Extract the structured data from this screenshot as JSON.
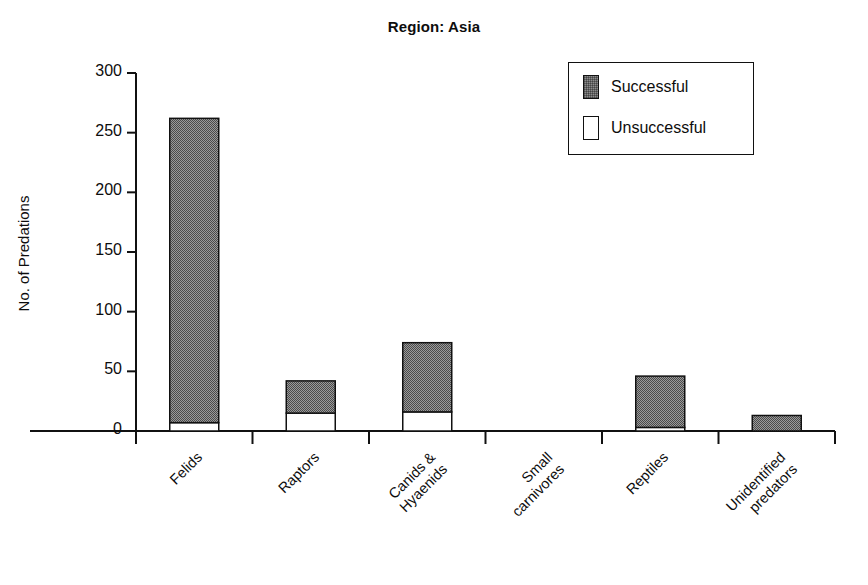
{
  "chart_data": {
    "type": "bar",
    "subtype": "stacked",
    "title": "Region: Asia",
    "xlabel": "",
    "ylabel": "No. of Predations",
    "categories": [
      "Felids",
      "Raptors",
      "Canids &\nHyaenids",
      "Small\ncarnivores",
      "Reptiles",
      "Unidentified\npredators"
    ],
    "categories_display": [
      "Felids",
      "Raptors",
      "Canids & Hyaenids",
      "Small carnivores",
      "Reptiles",
      "Unidentified predators"
    ],
    "series": [
      {
        "name": "Unsuccessful",
        "values": [
          7,
          15,
          16,
          0,
          3,
          0
        ],
        "color": "#ffffff"
      },
      {
        "name": "Successful",
        "values": [
          255,
          27,
          58,
          0,
          43,
          13
        ],
        "color": "#8d8d8d"
      }
    ],
    "totals": [
      262,
      42,
      74,
      0,
      46,
      13
    ],
    "ylim": [
      0,
      300
    ],
    "yticks": [
      0,
      50,
      100,
      150,
      200,
      250,
      300
    ],
    "ytick_labels": [
      "0",
      "50",
      "100",
      "150",
      "200",
      "250",
      "300"
    ],
    "grid": false,
    "legend_position": "top-right",
    "legend_entries": [
      "Successful",
      "Unsuccessful"
    ],
    "axis_color": "#111111",
    "bar_edge_color": "#111111"
  },
  "legend": {
    "successful_label": "Successful",
    "unsuccessful_label": "Unsuccessful"
  }
}
